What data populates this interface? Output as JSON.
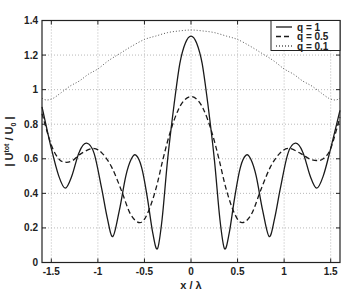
{
  "chart_data": {
    "type": "line",
    "title": "",
    "xlabel": "x / λ",
    "ylabel": "| U^tot / U_0 |",
    "ylabel_parts": {
      "open": "| U",
      "sup": "tot",
      "mid": " / U",
      "sub": "0",
      "close": " |"
    },
    "xlim": [
      -1.6,
      1.6
    ],
    "ylim": [
      0,
      1.4
    ],
    "grid": true,
    "legend_position": "upper right",
    "x_ticks": [
      -1.5,
      -1,
      -0.5,
      0,
      0.5,
      1,
      1.5
    ],
    "x_tick_labels": [
      "-1.5",
      "-1",
      "-0.5",
      "0",
      "0.5",
      "1",
      "1.5"
    ],
    "y_ticks": [
      0,
      0.2,
      0.4,
      0.6,
      0.8,
      1,
      1.2,
      1.4
    ],
    "y_tick_labels": [
      "0",
      "0.2",
      "0.4",
      "0.6",
      "0.8",
      "1",
      "1.2",
      "1.4"
    ],
    "series": [
      {
        "name": "q = 1",
        "style": "solid",
        "x": [
          -1.6,
          -1.5,
          -1.42,
          -1.35,
          -1.28,
          -1.2,
          -1.12,
          -1.04,
          -0.96,
          -0.9,
          -0.84,
          -0.77,
          -0.7,
          -0.64,
          -0.59,
          -0.53,
          -0.47,
          -0.41,
          -0.36,
          -0.31,
          -0.25,
          -0.18,
          -0.12,
          -0.06,
          0,
          0.06,
          0.12,
          0.18,
          0.25,
          0.31,
          0.36,
          0.41,
          0.47,
          0.53,
          0.59,
          0.64,
          0.7,
          0.77,
          0.84,
          0.9,
          0.96,
          1.04,
          1.12,
          1.2,
          1.28,
          1.35,
          1.42,
          1.5,
          1.6
        ],
        "values": [
          0.9,
          0.66,
          0.5,
          0.43,
          0.5,
          0.64,
          0.69,
          0.63,
          0.43,
          0.26,
          0.15,
          0.3,
          0.5,
          0.6,
          0.62,
          0.55,
          0.38,
          0.17,
          0.08,
          0.25,
          0.6,
          0.92,
          1.15,
          1.27,
          1.31,
          1.27,
          1.15,
          0.92,
          0.6,
          0.25,
          0.08,
          0.17,
          0.38,
          0.55,
          0.62,
          0.6,
          0.5,
          0.3,
          0.15,
          0.26,
          0.43,
          0.63,
          0.69,
          0.64,
          0.5,
          0.43,
          0.5,
          0.66,
          0.88
        ]
      },
      {
        "name": "q = 0.5",
        "style": "dashed",
        "x": [
          -1.6,
          -1.5,
          -1.42,
          -1.35,
          -1.27,
          -1.18,
          -1.05,
          -0.95,
          -0.85,
          -0.75,
          -0.65,
          -0.55,
          -0.47,
          -0.38,
          -0.3,
          -0.22,
          -0.14,
          -0.07,
          0,
          0.07,
          0.14,
          0.22,
          0.3,
          0.38,
          0.47,
          0.55,
          0.65,
          0.75,
          0.85,
          0.95,
          1.05,
          1.18,
          1.27,
          1.35,
          1.42,
          1.5,
          1.6
        ],
        "values": [
          0.86,
          0.68,
          0.6,
          0.58,
          0.59,
          0.63,
          0.66,
          0.63,
          0.55,
          0.42,
          0.28,
          0.23,
          0.28,
          0.42,
          0.6,
          0.76,
          0.88,
          0.94,
          0.96,
          0.94,
          0.88,
          0.76,
          0.6,
          0.42,
          0.28,
          0.23,
          0.28,
          0.42,
          0.55,
          0.63,
          0.66,
          0.63,
          0.6,
          0.59,
          0.6,
          0.66,
          0.84
        ]
      },
      {
        "name": "q = 0.1",
        "style": "dotted",
        "x": [
          -1.6,
          -1.55,
          -1.48,
          -1.4,
          -1.3,
          -1.2,
          -1.1,
          -1.0,
          -0.88,
          -0.76,
          -0.64,
          -0.5,
          -0.38,
          -0.25,
          -0.12,
          0,
          0.12,
          0.25,
          0.38,
          0.5,
          0.64,
          0.76,
          0.88,
          1.0,
          1.1,
          1.2,
          1.3,
          1.4,
          1.48,
          1.55,
          1.6
        ],
        "values": [
          0.95,
          0.94,
          0.95,
          0.98,
          1.02,
          1.05,
          1.09,
          1.12,
          1.17,
          1.21,
          1.25,
          1.29,
          1.31,
          1.33,
          1.34,
          1.345,
          1.34,
          1.33,
          1.31,
          1.29,
          1.25,
          1.21,
          1.17,
          1.12,
          1.09,
          1.05,
          1.02,
          0.98,
          0.95,
          0.94,
          0.95
        ]
      }
    ],
    "colors": {
      "axes": "#222222",
      "grid": "#b8b8b8",
      "line": "#1a1a1a"
    }
  },
  "legend": {
    "items": [
      {
        "label": "q = 1",
        "style": "solid"
      },
      {
        "label": "q = 0.5",
        "style": "dashed"
      },
      {
        "label": "q = 0.1",
        "style": "dotted"
      }
    ]
  }
}
